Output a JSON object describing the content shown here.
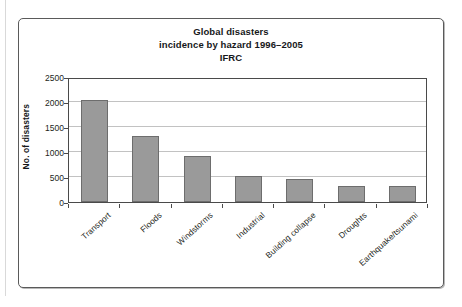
{
  "chart_data": {
    "type": "bar",
    "title": "Global disasters incidence by hazard 1996–2005 IFRC",
    "title_lines": [
      "Global disasters",
      "incidence by hazard 1996–2005",
      "IFRC"
    ],
    "categories": [
      "Transport",
      "Floods",
      "Windstorms",
      "Industrial",
      "Building collapse",
      "Droughts",
      "Earthquake/tsunami"
    ],
    "values": [
      2040,
      1320,
      930,
      520,
      470,
      320,
      320
    ],
    "xlabel": "",
    "ylabel": "No. of disasters",
    "ylim": [
      0,
      2500
    ],
    "ytick_labels": [
      "0",
      "500",
      "1000",
      "1500",
      "2000",
      "2500"
    ],
    "ytick_values": [
      0,
      500,
      1000,
      1500,
      2000,
      2500
    ],
    "grid": true,
    "legend": null,
    "bar_color": "#9a9a9a",
    "bar_border_color": "#6d6d6d",
    "gridline_color": "#c2c2c2",
    "axis_color": "#4a4a4a"
  },
  "figure": {
    "frame_border_color": "#5a5a5a",
    "background": "#ffffff"
  }
}
